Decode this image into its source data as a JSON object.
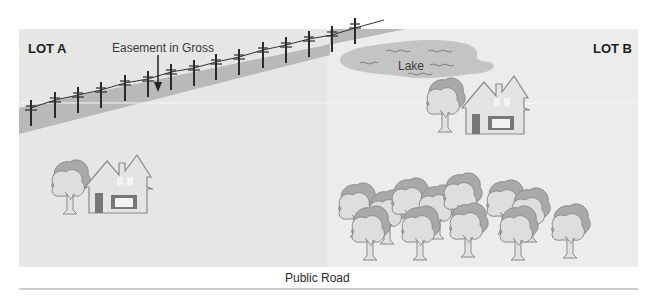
{
  "diagram": {
    "type": "property easement illustration",
    "lots": [
      {
        "id": "lot_a",
        "label": "LOT  A",
        "features": [
          "utility pole line easement",
          "house",
          "tree"
        ]
      },
      {
        "id": "lot_b",
        "label": "LOT  B",
        "features": [
          "lake",
          "house",
          "tree",
          "grove of trees"
        ]
      }
    ],
    "easement": {
      "label": "Easement in Gross",
      "pole_count": 15
    },
    "lake": {
      "label": "Lake"
    },
    "road": {
      "label": "Public Road"
    },
    "colors": {
      "background": "#ffffff",
      "lot_fill_a": "#e6e6e6",
      "lot_fill_b": "#ececec",
      "easement_band": "#b9b9b9",
      "lake": "#c4c4c4",
      "pole": "#2a2a2a",
      "outline": "#8a8a8a",
      "tree_foliage_light": "#dcdcdc",
      "tree_foliage_dark": "#a9a9a9",
      "road_line": "#9a9a9a"
    }
  }
}
